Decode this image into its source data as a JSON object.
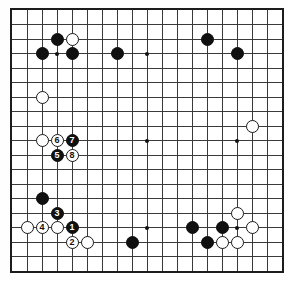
{
  "diagram": {
    "board_size": 19,
    "colors": {
      "background": "#ffffff",
      "grid_line": "#3a3a3a",
      "border": "#1c1c1c",
      "black_stone": "#101010",
      "white_stone": "#ffffff"
    },
    "star_points": [
      [
        3,
        3
      ],
      [
        9,
        3
      ],
      [
        15,
        3
      ],
      [
        3,
        9
      ],
      [
        9,
        9
      ],
      [
        15,
        9
      ],
      [
        3,
        15
      ],
      [
        9,
        15
      ],
      [
        15,
        15
      ]
    ],
    "stones": [
      {
        "col": 3,
        "row": 2,
        "color": "black",
        "label": ""
      },
      {
        "col": 4,
        "row": 2,
        "color": "white",
        "label": ""
      },
      {
        "col": 2,
        "row": 3,
        "color": "black",
        "label": ""
      },
      {
        "col": 4,
        "row": 3,
        "color": "black",
        "label": ""
      },
      {
        "col": 7,
        "row": 3,
        "color": "black",
        "label": ""
      },
      {
        "col": 13,
        "row": 2,
        "color": "black",
        "label": ""
      },
      {
        "col": 15,
        "row": 3,
        "color": "black",
        "label": ""
      },
      {
        "col": 2,
        "row": 6,
        "color": "white",
        "label": ""
      },
      {
        "col": 16,
        "row": 8,
        "color": "white",
        "label": ""
      },
      {
        "col": 2,
        "row": 9,
        "color": "white",
        "label": ""
      },
      {
        "col": 3,
        "row": 9,
        "color": "white",
        "label": "6"
      },
      {
        "col": 4,
        "row": 9,
        "color": "black",
        "label": "7"
      },
      {
        "col": 3,
        "row": 10,
        "color": "black",
        "label": "5"
      },
      {
        "col": 4,
        "row": 10,
        "color": "white",
        "label": "8"
      },
      {
        "col": 2,
        "row": 13,
        "color": "black",
        "label": ""
      },
      {
        "col": 3,
        "row": 14,
        "color": "black",
        "label": "3"
      },
      {
        "col": 1,
        "row": 15,
        "color": "white",
        "label": ""
      },
      {
        "col": 2,
        "row": 15,
        "color": "white",
        "label": "4"
      },
      {
        "col": 3,
        "row": 15,
        "color": "white",
        "label": ""
      },
      {
        "col": 4,
        "row": 15,
        "color": "black",
        "label": "1"
      },
      {
        "col": 4,
        "row": 16,
        "color": "white",
        "label": "2"
      },
      {
        "col": 5,
        "row": 16,
        "color": "white",
        "label": ""
      },
      {
        "col": 8,
        "row": 16,
        "color": "black",
        "label": ""
      },
      {
        "col": 15,
        "row": 14,
        "color": "white",
        "label": ""
      },
      {
        "col": 12,
        "row": 15,
        "color": "black",
        "label": ""
      },
      {
        "col": 14,
        "row": 15,
        "color": "black",
        "label": ""
      },
      {
        "col": 16,
        "row": 15,
        "color": "white",
        "label": ""
      },
      {
        "col": 13,
        "row": 16,
        "color": "black",
        "label": ""
      },
      {
        "col": 14,
        "row": 16,
        "color": "white",
        "label": ""
      },
      {
        "col": 15,
        "row": 16,
        "color": "white",
        "label": ""
      }
    ]
  }
}
